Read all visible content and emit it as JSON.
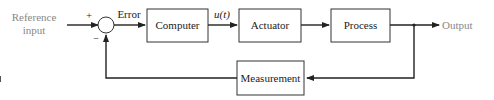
{
  "diagram": {
    "type": "feedback-control-block-diagram",
    "input": {
      "line1": "Reference",
      "line2": "input"
    },
    "summing_junction": {
      "plus_sign": "+",
      "minus_sign": "−"
    },
    "signals": {
      "error": "Error",
      "control": "u(t)",
      "output": "Output"
    },
    "blocks": [
      {
        "id": "computer",
        "label": "Computer"
      },
      {
        "id": "actuator",
        "label": "Actuator"
      },
      {
        "id": "process",
        "label": "Process"
      },
      {
        "id": "measurement",
        "label": "Measurement"
      }
    ],
    "edges": [
      [
        "Reference input",
        "summing_junction"
      ],
      [
        "summing_junction",
        "Computer"
      ],
      [
        "Computer",
        "Actuator"
      ],
      [
        "Actuator",
        "Process"
      ],
      [
        "Process",
        "Output"
      ],
      [
        "Process",
        "Measurement"
      ],
      [
        "Measurement",
        "summing_junction"
      ]
    ],
    "colors": {
      "lines": "#222222",
      "box_border": "#333333",
      "io_text": "#888888",
      "text": "#222222"
    }
  }
}
